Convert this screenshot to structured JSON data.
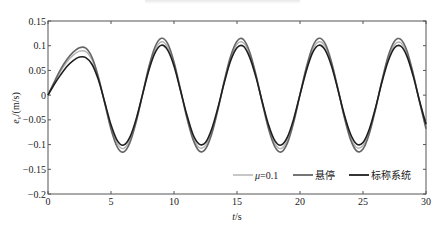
{
  "chart_data": {
    "type": "line",
    "title": "",
    "xlabel": "t/s",
    "ylabel": "e_v/(m/s)",
    "xlim": [
      0,
      30
    ],
    "ylim": [
      -0.2,
      0.15
    ],
    "xticks": [
      0,
      5,
      10,
      15,
      20,
      25,
      30
    ],
    "xtick_labels": [
      "0",
      "5",
      "10",
      "15",
      "20",
      "25",
      "30"
    ],
    "yticks": [
      -0.2,
      -0.15,
      -0.1,
      -0.05,
      0,
      0.05,
      0.1,
      0.15
    ],
    "ytick_labels": [
      "−0.2",
      "−0.15",
      "−0.1",
      "−0.05",
      "0",
      "0.05",
      "0.1",
      "0.15"
    ],
    "grid": false,
    "legend_position": "lower right (inside)",
    "x": [
      0,
      0.5,
      1,
      1.5,
      2,
      2.5,
      3,
      3.5,
      4,
      4.5,
      5,
      5.5,
      6,
      6.5,
      7,
      7.5,
      8,
      8.5,
      9,
      9.5,
      10,
      10.5,
      11,
      11.5,
      12,
      12.5,
      13,
      13.5,
      14,
      14.5,
      15,
      15.5,
      16,
      16.5,
      17,
      17.5,
      18,
      18.5,
      19,
      19.5,
      20,
      20.5,
      21,
      21.5,
      22,
      22.5,
      23,
      23.5,
      24,
      24.5,
      25,
      25.5,
      26,
      26.5,
      27,
      27.5,
      28,
      28.5,
      29,
      29.5,
      30
    ],
    "series": [
      {
        "name": "μ=0.1",
        "color": "#b4b4b4",
        "values": [
          0,
          0.025,
          0.048,
          0.067,
          0.081,
          0.089,
          0.088,
          0.071,
          0.035,
          -0.015,
          -0.065,
          -0.098,
          -0.108,
          -0.09,
          -0.051,
          0.001,
          0.053,
          0.092,
          0.108,
          0.097,
          0.063,
          0.012,
          -0.041,
          -0.084,
          -0.106,
          -0.102,
          -0.073,
          -0.026,
          0.028,
          0.074,
          0.103,
          0.106,
          0.083,
          0.039,
          -0.014,
          -0.064,
          -0.098,
          -0.108,
          -0.091,
          -0.051,
          0.001,
          0.053,
          0.092,
          0.108,
          0.098,
          0.063,
          0.013,
          -0.041,
          -0.084,
          -0.106,
          -0.102,
          -0.074,
          -0.026,
          0.028,
          0.074,
          0.102,
          0.106,
          0.083,
          0.04,
          -0.014,
          -0.064
        ]
      },
      {
        "name": "悬停",
        "color": "#666666",
        "values": [
          0,
          0.027,
          0.052,
          0.072,
          0.087,
          0.096,
          0.095,
          0.076,
          0.037,
          -0.016,
          -0.069,
          -0.105,
          -0.115,
          -0.096,
          -0.054,
          0.001,
          0.057,
          0.098,
          0.115,
          0.104,
          0.067,
          0.013,
          -0.044,
          -0.089,
          -0.113,
          -0.109,
          -0.078,
          -0.028,
          0.03,
          0.079,
          0.109,
          0.113,
          0.088,
          0.042,
          -0.015,
          -0.068,
          -0.104,
          -0.115,
          -0.097,
          -0.055,
          0.001,
          0.056,
          0.098,
          0.115,
          0.104,
          0.067,
          0.014,
          -0.043,
          -0.089,
          -0.113,
          -0.109,
          -0.078,
          -0.028,
          0.029,
          0.079,
          0.109,
          0.113,
          0.089,
          0.042,
          -0.015,
          -0.068
        ]
      },
      {
        "name": "标称系统",
        "color": "#1e1e1e",
        "values": [
          0,
          0.022,
          0.041,
          0.058,
          0.07,
          0.077,
          0.076,
          0.062,
          0.031,
          -0.014,
          -0.06,
          -0.092,
          -0.101,
          -0.085,
          -0.048,
          0.001,
          0.05,
          0.086,
          0.101,
          0.091,
          0.059,
          0.011,
          -0.038,
          -0.079,
          -0.099,
          -0.096,
          -0.068,
          -0.024,
          0.026,
          0.07,
          0.096,
          0.099,
          0.077,
          0.037,
          -0.013,
          -0.06,
          -0.092,
          -0.101,
          -0.085,
          -0.048,
          0.001,
          0.049,
          0.086,
          0.101,
          0.091,
          0.059,
          0.012,
          -0.038,
          -0.078,
          -0.099,
          -0.096,
          -0.069,
          -0.025,
          0.026,
          0.069,
          0.096,
          0.099,
          0.078,
          0.037,
          -0.013,
          -0.059
        ]
      }
    ]
  },
  "labels": {
    "xlabel_italic": "t",
    "xlabel_unit": "/s",
    "ylabel_italic": "e",
    "ylabel_sub": "v",
    "ylabel_unit": "/(m/s)",
    "legend_mu_symbol": "μ",
    "legend_mu_value": "=0.1",
    "legend_hover": "悬停",
    "legend_nominal": "标称系统"
  }
}
